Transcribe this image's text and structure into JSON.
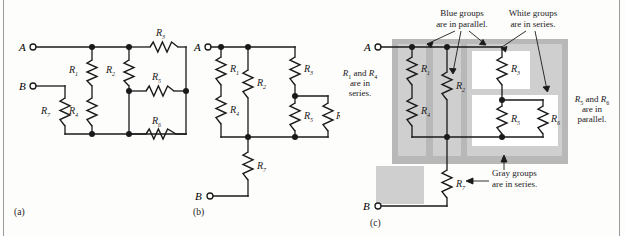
{
  "figure": {
    "title": "",
    "background": "#fdfdfc",
    "line_color": "#1a1a1a",
    "gray_outer": "#b9b9b9",
    "gray_group": "#cfcfcf",
    "white_group": "#ffffff",
    "panels": [
      {
        "id": "a",
        "caption": "(a)"
      },
      {
        "id": "b",
        "caption": "(b)"
      },
      {
        "id": "c",
        "caption": "(c)"
      }
    ]
  },
  "terminals": {
    "a_label": "A",
    "b_label": "B"
  },
  "resistors": {
    "r1": "R",
    "r1_sub": "1",
    "r2": "R",
    "r2_sub": "2",
    "r3": "R",
    "r3_sub": "3",
    "r4": "R",
    "r4_sub": "4",
    "r5": "R",
    "r5_sub": "5",
    "r6": "R",
    "r6_sub": "6",
    "r7": "R",
    "r7_sub": "7"
  },
  "panel_a": {
    "caption": "(a)",
    "terminal_a": "A",
    "terminal_b": "B",
    "labels": [
      "R1",
      "R2",
      "R3",
      "R4",
      "R5",
      "R6",
      "R7"
    ]
  },
  "panel_b": {
    "caption": "(b)",
    "terminal_a": "A",
    "terminal_b": "B",
    "labels": [
      "R1",
      "R2",
      "R3",
      "R4",
      "R5",
      "R6",
      "R7"
    ]
  },
  "panel_c": {
    "caption": "(c)",
    "terminal_a": "A",
    "terminal_b": "B",
    "labels": [
      "R1",
      "R2",
      "R3",
      "R4",
      "R5",
      "R6",
      "R7"
    ],
    "annotations": {
      "blue_groups": {
        "line1": "Blue groups",
        "line2": "are in parallel."
      },
      "white_groups": {
        "line1": "White groups",
        "line2": "are in series."
      },
      "r1_r4": {
        "line1": "R",
        "sub1": "1",
        "mid": " and ",
        "line2": "R",
        "sub2": "4",
        "line3": "are in",
        "line4": "series."
      },
      "r5_r6": {
        "line1": "R",
        "sub1": "5",
        "mid": " and ",
        "line2": "R",
        "sub2": "6",
        "line3": "are in",
        "line4": "parallel."
      },
      "gray_groups": {
        "line1": "Gray groups",
        "line2": "are in series."
      }
    }
  }
}
